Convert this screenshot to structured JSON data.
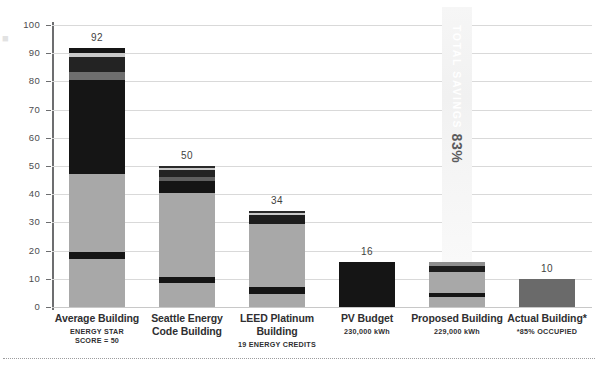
{
  "chart_data": {
    "type": "bar",
    "title": "",
    "subtitle": "",
    "xlabel": "",
    "ylabel": "",
    "ylim": [
      0,
      100
    ],
    "yticks": [
      0,
      10,
      20,
      30,
      40,
      50,
      60,
      70,
      80,
      90,
      100
    ],
    "grid": true,
    "legend": "none",
    "stacked": true,
    "categories": [
      "Average Building",
      "Seattle Energy Code Building",
      "LEED Platinum Building",
      "PV Budget",
      "Proposed Building",
      "Actual Building*"
    ],
    "totals": [
      92,
      50,
      34,
      16,
      16,
      10
    ],
    "value_labels": [
      "92",
      "50",
      "34",
      "16",
      "",
      "10"
    ],
    "bars": [
      {
        "category": "Average Building",
        "total": 92,
        "segments": [
          {
            "name": "base-gray-lower",
            "from": 0,
            "to": 17,
            "color": "#a8a8a8"
          },
          {
            "name": "dark-band-1",
            "from": 17,
            "to": 19.5,
            "color": "#151515"
          },
          {
            "name": "mid-gray",
            "from": 19.5,
            "to": 47,
            "color": "#a8a8a8"
          },
          {
            "name": "dark-block",
            "from": 47,
            "to": 80.5,
            "color": "#151515"
          },
          {
            "name": "gray-band-2",
            "from": 80.5,
            "to": 83.5,
            "color": "#6e6e6e"
          },
          {
            "name": "dark-band-2",
            "from": 83.5,
            "to": 88.5,
            "color": "#232323"
          },
          {
            "name": "light-band",
            "from": 88.5,
            "to": 90,
            "color": "#c9c9c9"
          },
          {
            "name": "dark-cap",
            "from": 90,
            "to": 92,
            "color": "#151515"
          }
        ]
      },
      {
        "category": "Seattle Energy Code Building",
        "total": 50,
        "segments": [
          {
            "name": "base-gray-lower",
            "from": 0,
            "to": 8.5,
            "color": "#a8a8a8"
          },
          {
            "name": "dark-band-1",
            "from": 8.5,
            "to": 10.5,
            "color": "#151515"
          },
          {
            "name": "mid-gray",
            "from": 10.5,
            "to": 40.5,
            "color": "#a8a8a8"
          },
          {
            "name": "dark-block",
            "from": 40.5,
            "to": 44.5,
            "color": "#151515"
          },
          {
            "name": "gray-band-2",
            "from": 44.5,
            "to": 46,
            "color": "#5f5f5f"
          },
          {
            "name": "dark-band-2",
            "from": 46,
            "to": 48.5,
            "color": "#232323"
          },
          {
            "name": "light-cap",
            "from": 48.5,
            "to": 49.3,
            "color": "#c9c9c9"
          },
          {
            "name": "dark-cap",
            "from": 49.3,
            "to": 50,
            "color": "#2a2a2a"
          }
        ]
      },
      {
        "category": "LEED Platinum Building",
        "total": 34,
        "segments": [
          {
            "name": "base-gray-lower",
            "from": 0,
            "to": 4.5,
            "color": "#a8a8a8"
          },
          {
            "name": "dark-band-1",
            "from": 4.5,
            "to": 7,
            "color": "#151515"
          },
          {
            "name": "mid-gray",
            "from": 7,
            "to": 29.5,
            "color": "#a8a8a8"
          },
          {
            "name": "dark-block",
            "from": 29.5,
            "to": 32.5,
            "color": "#1d1d1d"
          },
          {
            "name": "light-band",
            "from": 32.5,
            "to": 33.2,
            "color": "#c9c9c9"
          },
          {
            "name": "dark-cap",
            "from": 33.2,
            "to": 34,
            "color": "#2a2a2a"
          }
        ]
      },
      {
        "category": "PV Budget",
        "total": 16,
        "note": "230,000 kWh",
        "segments": [
          {
            "name": "solid-dark",
            "from": 0,
            "to": 16,
            "color": "#151515"
          }
        ]
      },
      {
        "category": "Proposed Building",
        "total": 16,
        "note": "229,000 kWh",
        "segments": [
          {
            "name": "base-gray-lower",
            "from": 0,
            "to": 3.5,
            "color": "#a8a8a8"
          },
          {
            "name": "dark-band-1",
            "from": 3.5,
            "to": 5,
            "color": "#151515"
          },
          {
            "name": "mid-gray",
            "from": 5,
            "to": 12.5,
            "color": "#a8a8a8"
          },
          {
            "name": "dark-band-2",
            "from": 12.5,
            "to": 14.5,
            "color": "#1d1d1d"
          },
          {
            "name": "light-cap",
            "from": 14.5,
            "to": 16,
            "color": "#8e8e8e"
          }
        ]
      },
      {
        "category": "Actual Building*",
        "total": 10,
        "segments": [
          {
            "name": "solid-mid-gray",
            "from": 0,
            "to": 10,
            "color": "#6a6a6a"
          }
        ]
      }
    ],
    "annotations": [
      {
        "name": "total-savings",
        "line1": "TOTAL SAVINGS",
        "line2": "83%",
        "attached_to": "Proposed Building",
        "orientation": "vertical"
      }
    ]
  },
  "axis": {
    "y_tick_labels": [
      "100",
      "90",
      "80",
      "70",
      "60",
      "50",
      "40",
      "30",
      "20",
      "10",
      "0"
    ]
  },
  "categories": [
    {
      "line1": "Average Building",
      "line2": "ENERGY STAR",
      "line3": "SCORE = 50",
      "value": "92"
    },
    {
      "line1": "Seattle Energy",
      "line1b": "Code Building",
      "line2": "",
      "line3": "",
      "value": "50"
    },
    {
      "line1": "LEED Platinum",
      "line1b": "Building",
      "line2": "19 ENERGY CREDITS",
      "line3": "",
      "value": "34"
    },
    {
      "line1": "PV Budget",
      "line2": "230,000 kWh",
      "line3": "",
      "value": "16"
    },
    {
      "line1": "Proposed Building",
      "line2": "229,000 kWh",
      "line3": "",
      "value": ""
    },
    {
      "line1": "Actual Building*",
      "line2": "*85% OCCUPIED",
      "line3": "",
      "value": "10"
    }
  ],
  "colors": {
    "axis": "#6d6e70",
    "grid": "#d9d9d9",
    "dark": "#151515",
    "gray": "#a8a8a8",
    "mid": "#6a6a6a",
    "text": "#2f2f31"
  }
}
